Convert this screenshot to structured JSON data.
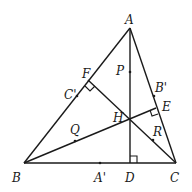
{
  "figure": {
    "points": {
      "A": {
        "label": "A",
        "x": 130,
        "y": 28
      },
      "B": {
        "label": "B",
        "x": 24,
        "y": 163
      },
      "C": {
        "label": "C",
        "x": 176,
        "y": 163
      },
      "D": {
        "label": "D",
        "x": 130,
        "y": 163
      },
      "E": {
        "label": "E",
        "x": 156,
        "y": 108
      },
      "F": {
        "label": "F",
        "x": 88,
        "y": 80
      },
      "H": {
        "label": "H",
        "x": 130,
        "y": 116
      },
      "P": {
        "label": "P",
        "x": 130,
        "y": 72
      },
      "Q": {
        "label": "Q",
        "x": 75,
        "y": 141
      },
      "R": {
        "label": "R",
        "x": 153,
        "y": 140
      },
      "A1": {
        "label": "A'",
        "x": 100,
        "y": 163
      },
      "B1": {
        "label": "B'",
        "x": 154,
        "y": 96
      },
      "C1": {
        "label": "C'",
        "x": 77,
        "y": 96
      }
    },
    "segments": [
      "AB",
      "BC",
      "CA",
      "AD",
      "BE",
      "CF"
    ],
    "right_angles": [
      "D",
      "E",
      "F"
    ]
  }
}
